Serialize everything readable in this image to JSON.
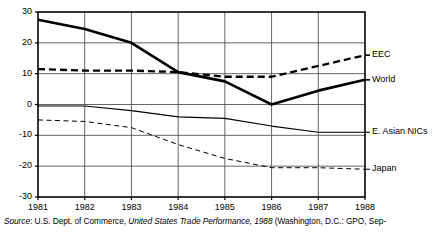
{
  "chart_data": {
    "type": "line",
    "title": "",
    "subtitle": "",
    "xlabel": "",
    "ylabel": "",
    "x": [
      1981,
      1982,
      1983,
      1984,
      1985,
      1986,
      1987,
      1988
    ],
    "categories": [
      "1981",
      "1982",
      "1983",
      "1984",
      "1985",
      "1986",
      "1987",
      "1988"
    ],
    "xlim": [
      1981,
      1988
    ],
    "ylim": [
      -30,
      30
    ],
    "yticks": [
      30,
      20,
      10,
      0,
      -10,
      -20,
      -30
    ],
    "ytick_labels": [
      "30",
      "20",
      "10",
      "0",
      "-10",
      "-20",
      "-30"
    ],
    "xticks": [
      1981,
      1982,
      1983,
      1984,
      1985,
      1986,
      1987,
      1988
    ],
    "grid": true,
    "legend_position": "right-of-axes-inline",
    "series": [
      {
        "name": "World",
        "style": "solid-thick",
        "values": [
          27.5,
          24.5,
          20.0,
          10.5,
          7.5,
          0.0,
          4.5,
          8.0
        ]
      },
      {
        "name": "EEC",
        "style": "dashed-thick",
        "values": [
          11.5,
          11.0,
          11.0,
          10.5,
          9.0,
          9.0,
          12.5,
          16.0
        ]
      },
      {
        "name": "E. Asian NICs",
        "style": "solid-thin",
        "values": [
          -0.5,
          -0.5,
          -2.0,
          -4.0,
          -4.5,
          -7.0,
          -9.0,
          -9.0
        ]
      },
      {
        "name": "Japan",
        "style": "dashed-thin",
        "values": [
          -5.0,
          -5.5,
          -7.5,
          -13.0,
          -17.5,
          -20.5,
          -20.5,
          -21.0
        ]
      }
    ]
  },
  "source_note": {
    "prefix_italic": "Source",
    "prefix_rest": ": U.S. Dept. of Commerce, ",
    "title_italic": "United States Trade Performance, 1988",
    "suffix": " (Washington, D.C.: GPO, Sep-"
  },
  "colors": {
    "ink": "#000000",
    "grid": "#555555",
    "background": "#ffffff"
  }
}
